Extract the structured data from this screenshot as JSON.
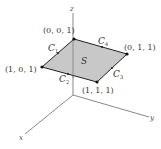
{
  "diagram": {
    "type": "3d-surface-boundary",
    "axes": {
      "x_label": "x",
      "y_label": "y",
      "z_label": "z"
    },
    "surface": {
      "label": "S",
      "fill_color": "#c8c8c8",
      "edge_color": "#222222"
    },
    "vertices": [
      {
        "id": "v001",
        "label": "(0, 0, 1)"
      },
      {
        "id": "v011",
        "label": "(0, 1, 1)"
      },
      {
        "id": "v111",
        "label": "(1, 1, 1)"
      },
      {
        "id": "v101",
        "label": "(1, 0, 1)"
      }
    ],
    "curves": [
      {
        "id": "C1",
        "label": "C",
        "sub": "1"
      },
      {
        "id": "C2",
        "label": "C",
        "sub": "2"
      },
      {
        "id": "C3",
        "label": "C",
        "sub": "3"
      },
      {
        "id": "C4",
        "label": "C",
        "sub": "4"
      }
    ]
  }
}
